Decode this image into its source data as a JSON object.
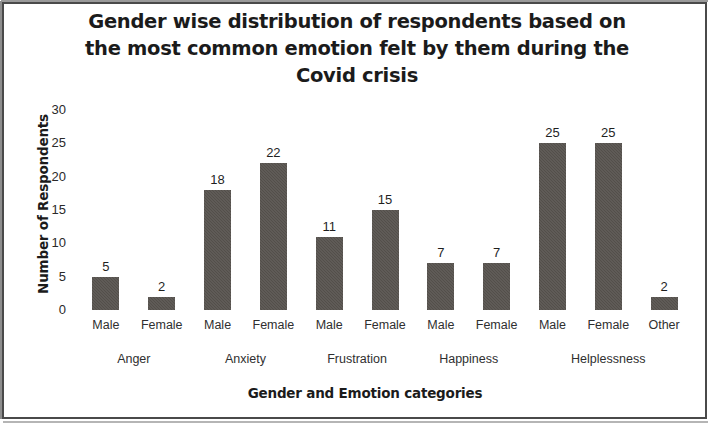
{
  "chart_data": {
    "type": "bar",
    "title_lines": [
      "Gender wise distribution of respondents based on",
      "the most common emotion felt by them during the",
      "Covid crisis"
    ],
    "xlabel": "Gender and Emotion categories",
    "ylabel": "Number of Respondents",
    "ylim": [
      0,
      30
    ],
    "yticks": [
      0,
      5,
      10,
      15,
      20,
      25,
      30
    ],
    "ytick_labels": [
      "0",
      "5",
      "10",
      "15",
      "20",
      "25",
      "30"
    ],
    "grid": false,
    "legend": "none",
    "bar_color": "#57534e",
    "categories": [
      "Male",
      "Female",
      "Male",
      "Female",
      "Male",
      "Female",
      "Male",
      "Female",
      "Male",
      "Female",
      "Other"
    ],
    "values": [
      5,
      2,
      18,
      22,
      11,
      15,
      7,
      7,
      25,
      25,
      2
    ],
    "data_labels": [
      "5",
      "2",
      "18",
      "22",
      "11",
      "15",
      "7",
      "7",
      "25",
      "25",
      "2"
    ],
    "groups": [
      {
        "label": "Anger",
        "start": 0,
        "count": 2
      },
      {
        "label": "Anxiety",
        "start": 2,
        "count": 2
      },
      {
        "label": "Frustration",
        "start": 4,
        "count": 2
      },
      {
        "label": "Happiness",
        "start": 6,
        "count": 2
      },
      {
        "label": "Helplessness",
        "start": 8,
        "count": 3
      }
    ]
  }
}
